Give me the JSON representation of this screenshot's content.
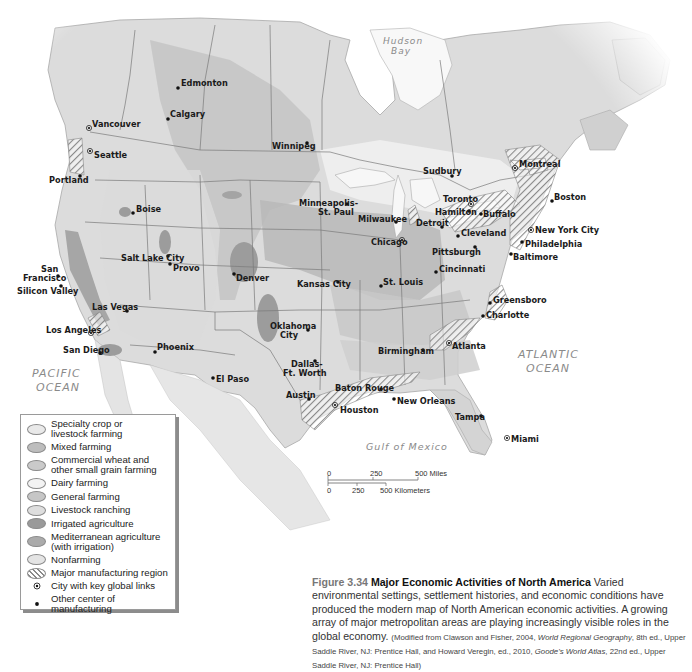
{
  "figure": {
    "number": "Figure 3.34",
    "title": "Major Economic Activities of North America",
    "caption": "Varied environmental settings, settlement histories, and economic conditions have produced the modern map of North American economic activities. A growing array of major metropolitan areas are playing increasingly visible roles in the global economy.",
    "source_1": "(Modified from Clawson and Fisher, 2004, ",
    "source_1_italic": "World Regional Geography",
    "source_2": ", 8th ed., Upper Saddle River, NJ: Prentice Hall, and Howard Veregin, ed., 2010, ",
    "source_2_italic": "Goode's World Atlas",
    "source_3": ", 22nd ed., Upper Saddle River, NJ: Prentice Hall)"
  },
  "water_labels": {
    "hudson_bay_1": "Hudson",
    "hudson_bay_2": "Bay",
    "pacific_1": "PACIFIC",
    "pacific_2": "OCEAN",
    "atlantic_1": "ATLANTIC",
    "atlantic_2": "OCEAN",
    "gulf": "Gulf of Mexico"
  },
  "scale_bar": {
    "miles_ticks": [
      "0",
      "250",
      "500 Miles"
    ],
    "km_ticks": [
      "0",
      "250",
      "500 Kilometers"
    ]
  },
  "legend": {
    "items": [
      {
        "label_1": "Specialty crop or",
        "label_2": "livestock farming",
        "color": "#e9e9e9",
        "type": "swatch"
      },
      {
        "label_1": "Mixed farming",
        "label_2": "",
        "color": "#bdbdbd",
        "type": "swatch"
      },
      {
        "label_1": "Commercial wheat and",
        "label_2": "other small grain farming",
        "color": "#cacaca",
        "type": "swatch"
      },
      {
        "label_1": "Dairy farming",
        "label_2": "",
        "color": "#f3f3f3",
        "type": "swatch"
      },
      {
        "label_1": "General farming",
        "label_2": "",
        "color": "#c6c6c6",
        "type": "swatch"
      },
      {
        "label_1": "Livestock ranching",
        "label_2": "",
        "color": "#dedede",
        "type": "swatch"
      },
      {
        "label_1": "Irrigated agriculture",
        "label_2": "",
        "color": "#9a9a9a",
        "type": "swatch"
      },
      {
        "label_1": "Mediterranean agriculture",
        "label_2": "(with irrigation)",
        "color": "#ababab",
        "type": "swatch"
      },
      {
        "label_1": "Nonfarming",
        "label_2": "",
        "color": "#e4e4e4",
        "type": "swatch"
      },
      {
        "label_1": "Major manufacturing region",
        "label_2": "",
        "color": "#ffffff",
        "type": "hatch"
      },
      {
        "label_1": "City with key global links",
        "label_2": "",
        "color": "#111111",
        "type": "ring-dot"
      },
      {
        "label_1": "Other center of manufacturing",
        "label_2": "",
        "color": "#111111",
        "type": "dot"
      }
    ]
  },
  "cities": [
    {
      "name": "Edmonton",
      "global": false
    },
    {
      "name": "Calgary",
      "global": false
    },
    {
      "name": "Vancouver",
      "global": true
    },
    {
      "name": "Seattle",
      "global": true
    },
    {
      "name": "Portland",
      "global": false
    },
    {
      "name": "Winnipeg",
      "global": false
    },
    {
      "name": "Boise",
      "global": false
    },
    {
      "name": "Salt Lake City",
      "global": false
    },
    {
      "name": "Provo",
      "global": false
    },
    {
      "name": "San",
      "global": false
    },
    {
      "name": "Francisco",
      "global": false
    },
    {
      "name": "Silicon Valley",
      "global": false
    },
    {
      "name": "Denver",
      "global": false
    },
    {
      "name": "Las Vegas",
      "global": false
    },
    {
      "name": "Los Angeles",
      "global": true
    },
    {
      "name": "San Diego",
      "global": false
    },
    {
      "name": "Phoenix",
      "global": false
    },
    {
      "name": "El Paso",
      "global": false
    },
    {
      "name": "Oklahoma",
      "global": false
    },
    {
      "name": "City",
      "global": false
    },
    {
      "name": "Dallas-",
      "global": false
    },
    {
      "name": "Ft. Worth",
      "global": false
    },
    {
      "name": "Austin",
      "global": false
    },
    {
      "name": "Houston",
      "global": true
    },
    {
      "name": "Baton Rouge",
      "global": false
    },
    {
      "name": "New Orleans",
      "global": false
    },
    {
      "name": "Minneapolis-",
      "global": false
    },
    {
      "name": "St. Paul",
      "global": false
    },
    {
      "name": "Milwaukee",
      "global": false
    },
    {
      "name": "Chicago",
      "global": true
    },
    {
      "name": "Kansas City",
      "global": false
    },
    {
      "name": "St. Louis",
      "global": false
    },
    {
      "name": "Detroit",
      "global": false
    },
    {
      "name": "Cleveland",
      "global": false
    },
    {
      "name": "Pittsburgh",
      "global": false
    },
    {
      "name": "Cincinnati",
      "global": false
    },
    {
      "name": "Sudbury",
      "global": false
    },
    {
      "name": "Toronto",
      "global": true
    },
    {
      "name": "Hamilton",
      "global": false
    },
    {
      "name": "Buffalo",
      "global": false
    },
    {
      "name": "Montreal",
      "global": true
    },
    {
      "name": "Boston",
      "global": false
    },
    {
      "name": "New York City",
      "global": true
    },
    {
      "name": "Philadelphia",
      "global": false
    },
    {
      "name": "Baltimore",
      "global": false
    },
    {
      "name": "Greensboro",
      "global": false
    },
    {
      "name": "Charlotte",
      "global": false
    },
    {
      "name": "Birmingham",
      "global": false
    },
    {
      "name": "Atlanta",
      "global": true
    },
    {
      "name": "Tampa",
      "global": false
    },
    {
      "name": "Miami",
      "global": true
    }
  ]
}
